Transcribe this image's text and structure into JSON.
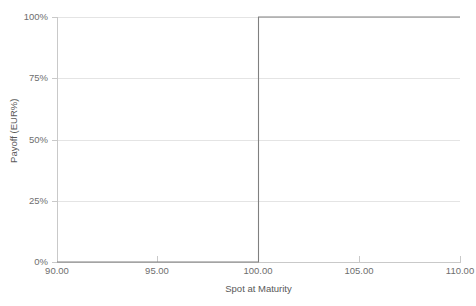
{
  "chart_data": {
    "type": "line",
    "title": "",
    "subtitle": "",
    "xlabel": "Spot at Maturity",
    "ylabel": "Payoff (EUR%)",
    "xlim": [
      90,
      110
    ],
    "ylim": [
      0,
      100
    ],
    "grid": "horizontal",
    "legend": "none",
    "line_style": "step",
    "x_tick_labels": [
      "90.00",
      "95.00",
      "100.00",
      "105.00",
      "110.00"
    ],
    "x_tick_values": [
      90,
      95,
      100,
      105,
      110
    ],
    "y_tick_labels": [
      "0%",
      "25%",
      "50%",
      "75%",
      "100%"
    ],
    "y_tick_values": [
      0,
      25,
      50,
      75,
      100
    ],
    "series": [
      {
        "name": "Payoff",
        "color": "#808080",
        "x": [
          90,
          100,
          100,
          110
        ],
        "values": [
          0,
          0,
          100,
          100
        ]
      }
    ],
    "annotations": [],
    "description_points": [
      {
        "spot": 90.0,
        "payoff_pct": 0
      },
      {
        "spot": 95.0,
        "payoff_pct": 0
      },
      {
        "spot": 99.99,
        "payoff_pct": 0
      },
      {
        "spot": 100.0,
        "payoff_pct": 100
      },
      {
        "spot": 105.0,
        "payoff_pct": 100
      },
      {
        "spot": 110.0,
        "payoff_pct": 100
      }
    ]
  },
  "axes": {
    "y_ticks": [
      {
        "label": "100%",
        "value": 100
      },
      {
        "label": "75%",
        "value": 75
      },
      {
        "label": "50%",
        "value": 50
      },
      {
        "label": "25%",
        "value": 25
      },
      {
        "label": "0%",
        "value": 0
      }
    ],
    "x_ticks": [
      {
        "label": "90.00",
        "value": 90
      },
      {
        "label": "95.00",
        "value": 95
      },
      {
        "label": "100.00",
        "value": 100
      },
      {
        "label": "105.00",
        "value": 105
      },
      {
        "label": "110.00",
        "value": 110
      }
    ],
    "x_title": "Spot at Maturity",
    "y_title": "Payoff (EUR%)"
  },
  "colors": {
    "series_line": "#808080",
    "gridline": "#e4e4e4",
    "axis_line": "#c9c9c9",
    "tick_text": "#6e6e6e",
    "axis_title_text": "#595959",
    "background": "#ffffff"
  }
}
